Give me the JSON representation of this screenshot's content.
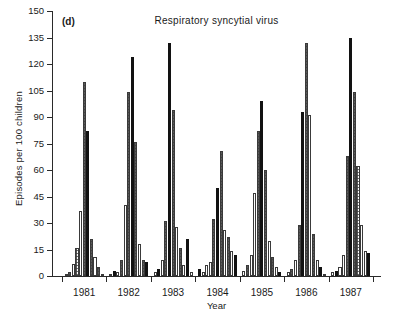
{
  "chart_data": {
    "type": "bar",
    "title": "Respiratory syncytial virus",
    "panel_label": "(d)",
    "xlabel": "Year",
    "ylabel": "Episodes per 100 children",
    "ylim": [
      0,
      150
    ],
    "yticks": [
      0,
      15,
      30,
      45,
      60,
      75,
      90,
      105,
      120,
      135,
      150
    ],
    "grid": false,
    "legend_position": "none",
    "categories": [
      "1981",
      "1982",
      "1983",
      "1984",
      "1985",
      "1986",
      "1987"
    ],
    "bar_styles": [
      "open",
      "hatch",
      "solid"
    ],
    "groups": [
      {
        "year": "1981",
        "bars": [
          {
            "style": "open",
            "value": 1
          },
          {
            "style": "hatch",
            "value": 2
          },
          {
            "style": "open",
            "value": 7
          },
          {
            "style": "hatch",
            "value": 16
          },
          {
            "style": "open",
            "value": 37
          },
          {
            "style": "hatch",
            "value": 110
          },
          {
            "style": "solid",
            "value": 82
          },
          {
            "style": "hatch",
            "value": 21
          },
          {
            "style": "open",
            "value": 11
          },
          {
            "style": "hatch",
            "value": 5
          },
          {
            "style": "open",
            "value": 1
          }
        ]
      },
      {
        "year": "1982",
        "bars": [
          {
            "style": "open",
            "value": 1
          },
          {
            "style": "solid",
            "value": 3
          },
          {
            "style": "open",
            "value": 2
          },
          {
            "style": "hatch",
            "value": 9
          },
          {
            "style": "open",
            "value": 40
          },
          {
            "style": "hatch",
            "value": 104
          },
          {
            "style": "solid",
            "value": 124
          },
          {
            "style": "hatch",
            "value": 76
          },
          {
            "style": "open",
            "value": 18
          },
          {
            "style": "hatch",
            "value": 9
          },
          {
            "style": "solid",
            "value": 8
          }
        ]
      },
      {
        "year": "1983",
        "bars": [
          {
            "style": "open",
            "value": 2
          },
          {
            "style": "solid",
            "value": 4
          },
          {
            "style": "open",
            "value": 9
          },
          {
            "style": "hatch",
            "value": 31
          },
          {
            "style": "solid",
            "value": 132
          },
          {
            "style": "hatch",
            "value": 94
          },
          {
            "style": "open",
            "value": 28
          },
          {
            "style": "hatch",
            "value": 16
          },
          {
            "style": "open",
            "value": 6
          },
          {
            "style": "solid",
            "value": 21
          },
          {
            "style": "open",
            "value": 2
          }
        ]
      },
      {
        "year": "1984",
        "bars": [
          {
            "style": "solid",
            "value": 4
          },
          {
            "style": "open",
            "value": 2
          },
          {
            "style": "open",
            "value": 6
          },
          {
            "style": "open",
            "value": 8
          },
          {
            "style": "hatch",
            "value": 32
          },
          {
            "style": "solid",
            "value": 50
          },
          {
            "style": "hatch",
            "value": 71
          },
          {
            "style": "open",
            "value": 26
          },
          {
            "style": "hatch",
            "value": 22
          },
          {
            "style": "open",
            "value": 14
          },
          {
            "style": "solid",
            "value": 12
          }
        ]
      },
      {
        "year": "1985",
        "bars": [
          {
            "style": "open",
            "value": 3
          },
          {
            "style": "hatch",
            "value": 6
          },
          {
            "style": "open",
            "value": 12
          },
          {
            "style": "open",
            "value": 47
          },
          {
            "style": "hatch",
            "value": 82
          },
          {
            "style": "solid",
            "value": 99
          },
          {
            "style": "hatch",
            "value": 60
          },
          {
            "style": "open",
            "value": 20
          },
          {
            "style": "hatch",
            "value": 11
          },
          {
            "style": "open",
            "value": 5
          },
          {
            "style": "solid",
            "value": 2
          }
        ]
      },
      {
        "year": "1986",
        "bars": [
          {
            "style": "open",
            "value": 2
          },
          {
            "style": "hatch",
            "value": 4
          },
          {
            "style": "open",
            "value": 9
          },
          {
            "style": "hatch",
            "value": 29
          },
          {
            "style": "solid",
            "value": 93
          },
          {
            "style": "hatch",
            "value": 132
          },
          {
            "style": "open",
            "value": 91
          },
          {
            "style": "hatch",
            "value": 24
          },
          {
            "style": "open",
            "value": 9
          },
          {
            "style": "solid",
            "value": 5
          },
          {
            "style": "open",
            "value": 1
          }
        ]
      },
      {
        "year": "1987",
        "bars": [
          {
            "style": "open",
            "value": 2
          },
          {
            "style": "solid",
            "value": 3
          },
          {
            "style": "open",
            "value": 5
          },
          {
            "style": "open",
            "value": 12
          },
          {
            "style": "hatch",
            "value": 68
          },
          {
            "style": "solid",
            "value": 135
          },
          {
            "style": "hatch",
            "value": 104
          },
          {
            "style": "hatch",
            "value": 62
          },
          {
            "style": "open",
            "value": 29
          },
          {
            "style": "open",
            "value": 14
          },
          {
            "style": "solid",
            "value": 13
          }
        ]
      }
    ]
  }
}
